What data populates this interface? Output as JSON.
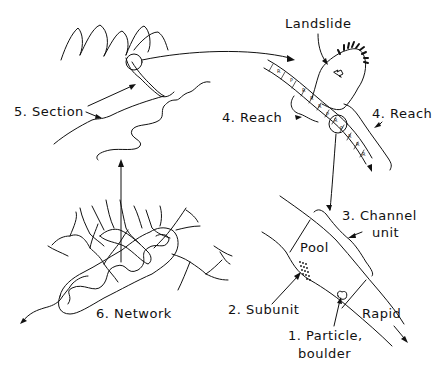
{
  "colors": {
    "ink": "#111111",
    "background": "#ffffff"
  },
  "labels": {
    "section": "5. Section",
    "landslide": "Landslide",
    "reach_left": "4. Reach",
    "reach_right": "4. Reach",
    "network": "6. Network",
    "channel_unit_line1": "3. Channel",
    "channel_unit_line2": "unit",
    "pool": "Pool",
    "subunit": "2. Subunit",
    "rapid": "Rapid",
    "particle_line1": "1. Particle,",
    "particle_line2": "boulder"
  },
  "reach_units": [
    "R",
    "P",
    "R",
    "R",
    "R",
    "P",
    "R",
    "P",
    "R",
    "R",
    "R"
  ]
}
